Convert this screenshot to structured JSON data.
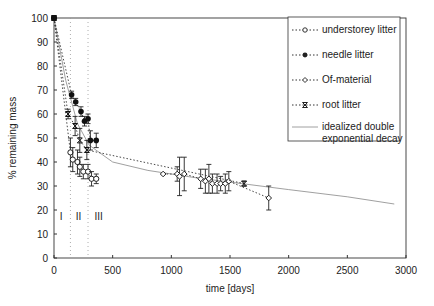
{
  "chart_data": {
    "type": "scatter",
    "title": "",
    "xlabel": "time [days]",
    "ylabel": "% remaining mass",
    "xlim": [
      0,
      3000
    ],
    "ylim": [
      0,
      100
    ],
    "xticks": [
      0,
      500,
      1000,
      1500,
      2000,
      2500,
      3000
    ],
    "yticks": [
      0,
      10,
      20,
      30,
      40,
      50,
      60,
      70,
      80,
      90,
      100
    ],
    "grid": false,
    "legend_position": "upper right",
    "phase_lines": [
      140,
      290
    ],
    "phase_labels": [
      {
        "text": "I",
        "x": 60
      },
      {
        "text": "II",
        "x": 210
      },
      {
        "text": "III",
        "x": 380
      }
    ],
    "series": [
      {
        "name": "understorey litter",
        "marker": "open-circle",
        "points": [
          [
            0,
            100
          ],
          [
            140,
            44,
            6
          ],
          [
            160,
            41,
            5
          ],
          [
            200,
            40,
            5
          ],
          [
            220,
            38,
            4
          ],
          [
            250,
            36,
            3
          ],
          [
            290,
            36,
            3
          ],
          [
            320,
            33,
            3
          ],
          [
            360,
            33,
            2
          ]
        ]
      },
      {
        "name": "needle litter",
        "marker": "filled-circle",
        "points": [
          [
            0,
            100
          ],
          [
            150,
            68,
            1.5
          ],
          [
            185,
            65,
            1.5
          ],
          [
            230,
            61,
            2
          ],
          [
            260,
            57,
            2
          ],
          [
            290,
            58,
            2
          ],
          [
            310,
            49,
            4
          ],
          [
            360,
            49,
            3
          ]
        ]
      },
      {
        "name": "Of-material",
        "marker": "open-diamond",
        "points": [
          [
            930,
            35,
            0
          ],
          [
            1050,
            35,
            3
          ],
          [
            1070,
            34,
            8
          ],
          [
            1110,
            35,
            7
          ],
          [
            1250,
            33,
            4
          ],
          [
            1290,
            32,
            5
          ],
          [
            1320,
            33,
            6
          ],
          [
            1350,
            31,
            4
          ],
          [
            1390,
            31,
            4
          ],
          [
            1420,
            31,
            3
          ],
          [
            1460,
            31,
            4
          ],
          [
            1490,
            32,
            4
          ],
          [
            1830,
            25,
            5
          ]
        ]
      },
      {
        "name": "root litter",
        "marker": "x-bar",
        "points": [
          [
            0,
            100
          ],
          [
            120,
            60,
            2
          ],
          [
            180,
            55,
            4
          ],
          [
            220,
            49,
            5
          ],
          [
            280,
            45,
            4
          ],
          [
            1620,
            31,
            1
          ]
        ]
      },
      {
        "name": "idealized double exponential decay",
        "marker": "line",
        "points": [
          [
            0,
            100
          ],
          [
            100,
            74
          ],
          [
            200,
            56
          ],
          [
            300,
            47
          ],
          [
            500,
            40
          ],
          [
            800,
            36.5
          ],
          [
            1200,
            33.5
          ],
          [
            1600,
            31
          ],
          [
            2000,
            28.5
          ],
          [
            2500,
            25.5
          ],
          [
            2900,
            22.5
          ]
        ]
      }
    ]
  },
  "legend": {
    "items": [
      {
        "label": "understorey litter"
      },
      {
        "label": "needle litter"
      },
      {
        "label": "Of-material"
      },
      {
        "label": "root litter"
      },
      {
        "label": "idealized double",
        "label2": "exponential decay"
      }
    ]
  },
  "axes": {
    "xlabel": "time [days]",
    "ylabel": "% remaining mass",
    "xtick_labels": [
      "0",
      "500",
      "1000",
      "1500",
      "2000",
      "2500",
      "3000"
    ],
    "ytick_labels": [
      "0",
      "10",
      "20",
      "30",
      "40",
      "50",
      "60",
      "70",
      "80",
      "90",
      "100"
    ],
    "phase_labels": [
      "I",
      "II",
      "III"
    ]
  }
}
